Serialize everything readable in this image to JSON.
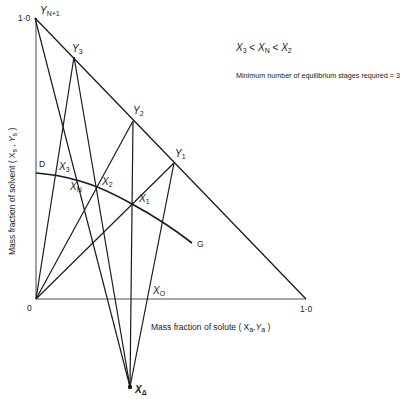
{
  "figure": {
    "annotation_inequality": {
      "a": "X",
      "a_sub": "3",
      "op1": "<",
      "b": "X",
      "b_sub": "N",
      "op2": "<",
      "c": "X",
      "c_sub": "2"
    },
    "annotation_stages": "Minimum number of equilibrium stages required = 3",
    "x_axis_label": "Mass fraction of solute ( X",
    "x_axis_label_sub1": "a",
    "x_axis_label_mid": ",Y",
    "x_axis_label_sub2": "a",
    "x_axis_label_end": " )",
    "y_axis_label": "Mass fraction of solvent  ( X",
    "y_axis_label_sub1": "s",
    "y_axis_label_mid": " , Y",
    "y_axis_label_sub2": "s",
    "y_axis_label_end": " )",
    "origin_label": "0",
    "x_max_label": "1·0",
    "y_max_label": "1·0",
    "curve_start_label": "D",
    "curve_end_label": "G",
    "points": {
      "YN1": {
        "main": "Y",
        "sub": "N+1"
      },
      "Y3": {
        "main": "Y",
        "sub": "3"
      },
      "Y2": {
        "main": "Y",
        "sub": "2"
      },
      "Y1": {
        "main": "Y",
        "sub": "1"
      },
      "X3": {
        "main": "X",
        "sub": "3"
      },
      "XN": {
        "main": "X",
        "sub": "N"
      },
      "X2": {
        "main": "X",
        "sub": "2"
      },
      "X1": {
        "main": "X",
        "sub": "1"
      },
      "X0": {
        "main": "X",
        "sub": "O"
      },
      "XD": {
        "main": "X",
        "sub": "Δ"
      }
    },
    "colors": {
      "line": "#1a1a1a",
      "axis": "#555555",
      "background": "#ffffff"
    }
  }
}
